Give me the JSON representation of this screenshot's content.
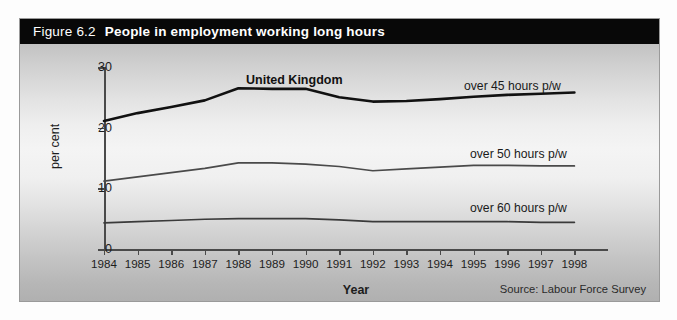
{
  "figure": {
    "number": "Figure 6.2",
    "title": "People in employment working long hours",
    "subtitle": "United Kingdom",
    "source": "Source: Labour Force Survey",
    "title_bar_color": "#080808",
    "title_text_color": "#ffffff"
  },
  "axes": {
    "ylabel": "per cent",
    "xlabel": "Year",
    "yticks": [
      "0",
      "10",
      "20",
      "30"
    ],
    "xticks": [
      "1984",
      "1985",
      "1986",
      "1987",
      "1988",
      "1989",
      "1990",
      "1991",
      "1992",
      "1993",
      "1994",
      "1995",
      "1996",
      "1997",
      "1998"
    ]
  },
  "legend": {
    "series45": "over 45 hours p/w",
    "series50": "over 50 hours p/w",
    "series60": "over 60 hours p/w"
  },
  "chart_data": {
    "type": "line",
    "title": "People in employment working long hours",
    "subtitle": "United Kingdom",
    "xlabel": "Year",
    "ylabel": "per cent",
    "source": "Source: Labour Force Survey",
    "grid": false,
    "legend_position": "inline-right",
    "xlim": [
      1984,
      1998
    ],
    "ylim": [
      0,
      30
    ],
    "yticks": [
      0,
      10,
      20,
      30
    ],
    "x": [
      1984,
      1985,
      1986,
      1987,
      1988,
      1989,
      1990,
      1991,
      1992,
      1993,
      1994,
      1995,
      1996,
      1997,
      1998
    ],
    "series": [
      {
        "name": "over 45 hours p/w",
        "color": "#111111",
        "width": 2.6,
        "values": [
          21.1,
          22.4,
          23.4,
          24.5,
          26.5,
          26.4,
          26.4,
          25.0,
          24.3,
          24.4,
          24.7,
          25.1,
          25.4,
          25.6,
          25.8
        ]
      },
      {
        "name": "over 50 hours p/w",
        "color": "#4a4a4a",
        "width": 1.7,
        "values": [
          11.2,
          11.9,
          12.6,
          13.3,
          14.2,
          14.2,
          14.0,
          13.6,
          12.9,
          13.2,
          13.5,
          13.8,
          13.8,
          13.7,
          13.7
        ]
      },
      {
        "name": "over 60 hours p/w",
        "color": "#3a3a3a",
        "width": 1.7,
        "values": [
          4.3,
          4.5,
          4.7,
          4.9,
          5.0,
          5.0,
          5.0,
          4.8,
          4.5,
          4.5,
          4.5,
          4.5,
          4.5,
          4.4,
          4.4
        ]
      }
    ]
  }
}
